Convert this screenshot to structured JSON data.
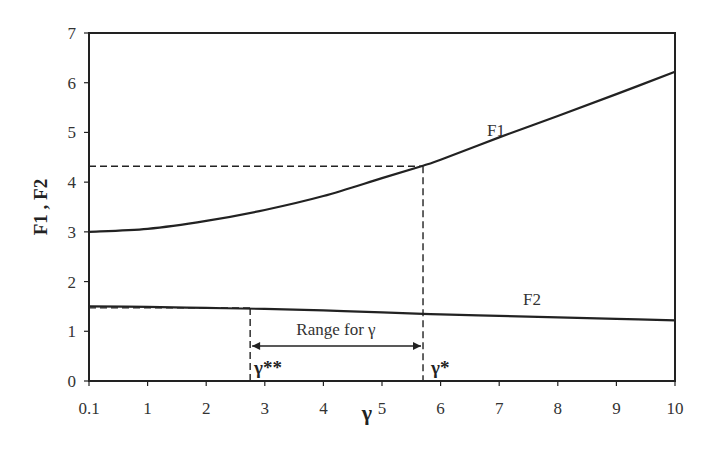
{
  "chart_data": {
    "type": "line",
    "title": "",
    "xlabel": "γ",
    "ylabel": "F1 , F2",
    "x_ticks": [
      "0.1",
      "1",
      "2",
      "3",
      "4",
      "5",
      "6",
      "7",
      "8",
      "9",
      "10"
    ],
    "y_ticks": [
      "0",
      "1",
      "2",
      "3",
      "4",
      "5",
      "6",
      "7"
    ],
    "xlim": [
      0.1,
      10
    ],
    "ylim": [
      0,
      7
    ],
    "grid": false,
    "legend": "none",
    "x": [
      0.1,
      1,
      2,
      3,
      4,
      5,
      5.7,
      6,
      7,
      8,
      9,
      10
    ],
    "series": [
      {
        "name": "F1",
        "values": [
          3.0,
          3.06,
          3.22,
          3.44,
          3.72,
          4.08,
          4.33,
          4.45,
          4.9,
          5.33,
          5.77,
          6.22
        ]
      },
      {
        "name": "F2",
        "values": [
          1.5,
          1.49,
          1.47,
          1.45,
          1.42,
          1.38,
          1.35,
          1.34,
          1.31,
          1.28,
          1.25,
          1.22
        ]
      }
    ],
    "annotations": {
      "range_label": "Range for γ",
      "gamma_star": {
        "label": "γ*",
        "x": 5.7,
        "f1_value": 4.32
      },
      "gamma_double_star": {
        "label": "γ**",
        "x": 2.75,
        "f2_value": 1.47
      },
      "series_labels": {
        "F1": "F1",
        "F2": "F2"
      }
    }
  }
}
